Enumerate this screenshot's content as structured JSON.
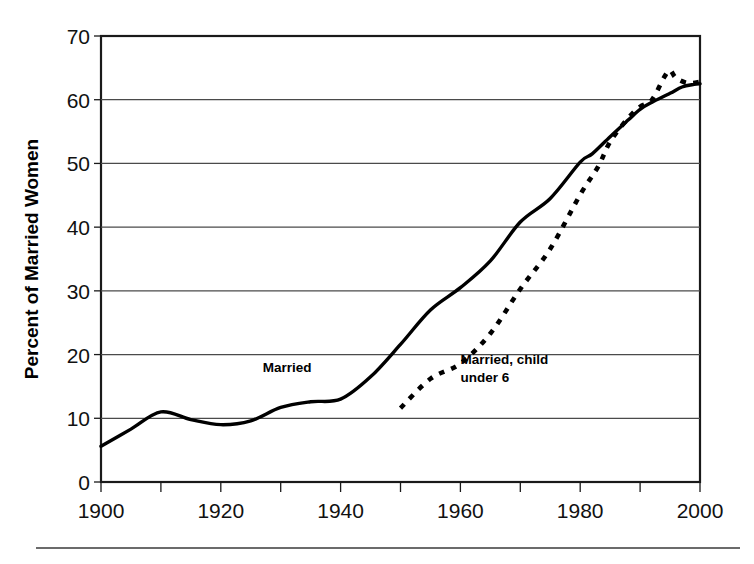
{
  "chart_data": {
    "type": "line",
    "title": "",
    "subtitle": "",
    "xlabel": "",
    "ylabel": "Percent of Married Women",
    "xlim": [
      1900,
      2000
    ],
    "ylim": [
      0,
      70
    ],
    "grid": true,
    "grid_axis": "y",
    "legend": "inline-annotations",
    "y_ticks": [
      0,
      10,
      20,
      30,
      40,
      50,
      60,
      70
    ],
    "y_tick_labels": [
      "0",
      "10",
      "20",
      "30",
      "40",
      "50",
      "60",
      "70"
    ],
    "x_ticks": [
      1900,
      1910,
      1920,
      1930,
      1940,
      1950,
      1960,
      1970,
      1980,
      1990,
      2000
    ],
    "x_tick_labels": [
      "1900",
      "",
      "1920",
      "",
      "1940",
      "",
      "1960",
      "",
      "1980",
      "",
      "2000"
    ],
    "x_labeled_ticks": [
      1900,
      1920,
      1940,
      1960,
      1980,
      2000
    ],
    "series": [
      {
        "name": "Married",
        "style": "solid",
        "color": "#000000",
        "x": [
          1900,
          1905,
          1910,
          1915,
          1920,
          1925,
          1930,
          1935,
          1940,
          1945,
          1950,
          1955,
          1960,
          1965,
          1970,
          1975,
          1980,
          1982,
          1985,
          1988,
          1990,
          1992,
          1995,
          1997,
          1999,
          2000
        ],
        "values": [
          5.6,
          8.3,
          11.0,
          9.8,
          9.0,
          9.6,
          11.7,
          12.6,
          13.0,
          16.5,
          21.6,
          27.0,
          30.5,
          34.7,
          40.8,
          44.5,
          50.2,
          51.5,
          54.2,
          56.8,
          58.5,
          59.6,
          61.0,
          62.0,
          62.4,
          62.5
        ]
      },
      {
        "name": "Married, child under 6",
        "style": "dashed",
        "color": "#000000",
        "x": [
          1950,
          1955,
          1960,
          1965,
          1970,
          1975,
          1980,
          1983,
          1985,
          1988,
          1990,
          1992,
          1994,
          1995,
          1996,
          1998,
          2000
        ],
        "values": [
          11.6,
          16.2,
          18.6,
          23.3,
          30.3,
          36.6,
          45.1,
          49.5,
          53.4,
          57.1,
          58.9,
          60.0,
          63.5,
          64.6,
          63.4,
          62.6,
          62.8
        ]
      }
    ],
    "annotations": [
      {
        "name": "married-label",
        "text": "Married",
        "lines": [
          "Married"
        ],
        "x": 1927,
        "y": 17.3
      },
      {
        "name": "married-child-under-6-label",
        "text": "Married, child under 6",
        "lines": [
          "Married, child",
          "under 6"
        ],
        "x": 1960,
        "y": 18.5
      }
    ]
  },
  "figure": {
    "y_axis_title": "Percent of Married Women",
    "footer_rule_visible": true
  }
}
